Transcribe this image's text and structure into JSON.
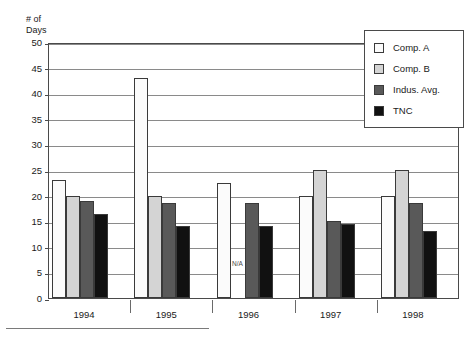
{
  "chart_data": {
    "type": "bar",
    "title": "",
    "ylabel": "# of\nDays",
    "xlabel": "",
    "categories": [
      "1994",
      "1995",
      "1996",
      "1997",
      "1998"
    ],
    "ylim": [
      0,
      50
    ],
    "ytick_step": 5,
    "yticks": [
      0,
      5,
      10,
      15,
      20,
      25,
      30,
      35,
      40,
      45,
      50
    ],
    "grid": true,
    "legend_position": "top-right",
    "series": [
      {
        "name": "Comp. A",
        "color": "#fbfbfb",
        "values": [
          23,
          43,
          22.5,
          20,
          20
        ]
      },
      {
        "name": "Comp. B",
        "color": "#d4d4d4",
        "values": [
          20,
          20,
          null,
          25,
          25
        ]
      },
      {
        "name": "Indus. Avg.",
        "color": "#595959",
        "values": [
          19,
          18.5,
          18.5,
          15,
          18.5
        ]
      },
      {
        "name": "TNC",
        "color": "#111111",
        "values": [
          16.5,
          14,
          14,
          14.5,
          13
        ]
      }
    ],
    "annotations": [
      {
        "text": "N/A",
        "category": "1996",
        "series": "Comp. B",
        "value": 7
      }
    ]
  }
}
